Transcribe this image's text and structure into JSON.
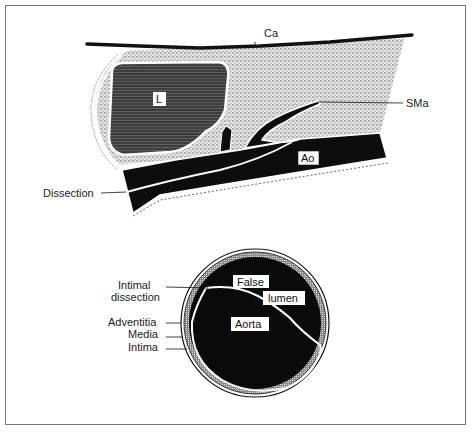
{
  "figure": {
    "top_diagram": {
      "description": "Sagittal view of abdominal aorta with superior mesenteric artery, liver and intimal dissection",
      "labels": {
        "ca": "Ca",
        "liver": "L",
        "sma": "SMa",
        "aorta": "Ao",
        "dissection": "Dissection"
      }
    },
    "bottom_diagram": {
      "description": "Cross-section of aorta showing false lumen separated by intimal flap",
      "labels": {
        "false": "False",
        "lumen": "lumen",
        "aorta": "Aorta",
        "intimal_dissection_line1": "Intimal",
        "intimal_dissection_line2": "dissection",
        "adventitia": "Adventitia",
        "media": "Media",
        "intima": "Intima"
      }
    },
    "colors": {
      "background": "#ffffff",
      "ink": "#111111",
      "stipple": "#c8c8c8",
      "liver": "#4a4a4a",
      "frame": "#777777"
    }
  }
}
